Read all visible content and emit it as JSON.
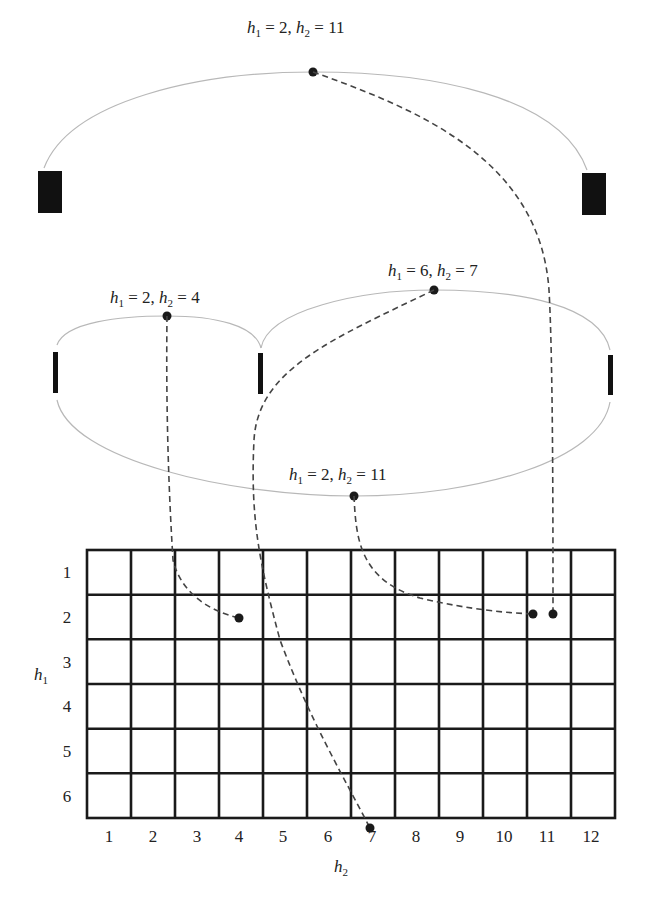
{
  "diagram": {
    "type": "cladogram-to-grid mapping",
    "nodes": [
      {
        "id": "top",
        "label": "h1 = 2, h2 = 11",
        "h1": 2,
        "h2": 11
      },
      {
        "id": "middle-left",
        "label": "h1 = 2, h2 = 4",
        "h1": 2,
        "h2": 4
      },
      {
        "id": "middle-right",
        "label": "h1 = 6, h2 = 7",
        "h1": 6,
        "h2": 7
      },
      {
        "id": "middle-bottom",
        "label": "h1 = 2, h2 = 11",
        "h1": 2,
        "h2": 11
      }
    ],
    "grid": {
      "rows": 6,
      "cols": 12,
      "row_labels": [
        "1",
        "2",
        "3",
        "4",
        "5",
        "6"
      ],
      "col_labels": [
        "1",
        "2",
        "3",
        "4",
        "5",
        "6",
        "7",
        "8",
        "9",
        "10",
        "11",
        "12"
      ],
      "y_axis_label": "h",
      "y_axis_sub": "1",
      "x_axis_label": "h",
      "x_axis_sub": "2"
    },
    "labels": {
      "top": {
        "a": "h",
        "as": "1",
        "av": " = 2, ",
        "b": "h",
        "bs": "2",
        "bv": " = 11"
      },
      "left": {
        "a": "h",
        "as": "1",
        "av": " = 2, ",
        "b": "h",
        "bs": "2",
        "bv": " = 4"
      },
      "right": {
        "a": "h",
        "as": "1",
        "av": " = 6, ",
        "b": "h",
        "bs": "2",
        "bv": " = 7"
      },
      "bottom": {
        "a": "h",
        "as": "1",
        "av": " = 2, ",
        "b": "h",
        "bs": "2",
        "bv": " = 11"
      }
    },
    "colors": {
      "arc": "#b8b8b8",
      "dashed": "#444444",
      "grid": "#1a1a1a",
      "dot": "#1a1a1a"
    }
  }
}
